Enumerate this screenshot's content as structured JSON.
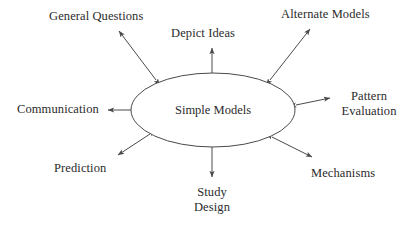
{
  "diagram": {
    "type": "hub-and-spoke",
    "center": {
      "name": "simple-models",
      "label": "Simple Models",
      "shape": "ellipse",
      "cx": 213,
      "cy": 110,
      "rx": 82,
      "ry": 37
    },
    "style": {
      "background": "#ffffff",
      "stroke": "#4a4a4a",
      "text": "#2b2b2b",
      "stroke_width": 1
    },
    "connector_style": "double-headed-arrow",
    "nodes": [
      {
        "name": "general-questions",
        "label": "General Questions",
        "position": "upper-left",
        "lines": [
          "General Questions"
        ]
      },
      {
        "name": "depict-ideas",
        "label": "Depict Ideas",
        "position": "top",
        "lines": [
          "Depict Ideas"
        ]
      },
      {
        "name": "alternate-models",
        "label": "Alternate Models",
        "position": "upper-right",
        "lines": [
          "Alternate Models"
        ]
      },
      {
        "name": "pattern-evaluation",
        "label": "Pattern Evaluation",
        "position": "right",
        "lines": [
          "Pattern",
          "Evaluation"
        ]
      },
      {
        "name": "mechanisms",
        "label": "Mechanisms",
        "position": "lower-right",
        "lines": [
          "Mechanisms"
        ]
      },
      {
        "name": "study-design",
        "label": "Study Design",
        "position": "bottom",
        "lines": [
          "Study",
          "Design"
        ]
      },
      {
        "name": "prediction",
        "label": "Prediction",
        "position": "lower-left",
        "lines": [
          "Prediction"
        ]
      },
      {
        "name": "communication",
        "label": "Communication",
        "position": "left",
        "lines": [
          "Communication"
        ]
      }
    ]
  }
}
